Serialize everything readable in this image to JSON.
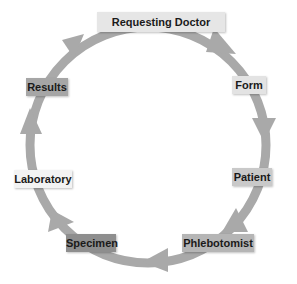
{
  "diagram": {
    "type": "cycle",
    "direction": "clockwise",
    "ring_color": "#a9a9a9",
    "nodes": [
      {
        "label": "Requesting Doctor",
        "color": "#e6e6e6"
      },
      {
        "label": "Form",
        "color": "#e3e3e3"
      },
      {
        "label": "Patient",
        "color": "#c9c9c9"
      },
      {
        "label": "Phlebotomist",
        "color": "#b5b5b5"
      },
      {
        "label": "Specimen",
        "color": "#8e8e8e"
      },
      {
        "label": "Laboratory",
        "color": "#f3f3f3"
      },
      {
        "label": "Results",
        "color": "#a6a6a6"
      }
    ]
  }
}
